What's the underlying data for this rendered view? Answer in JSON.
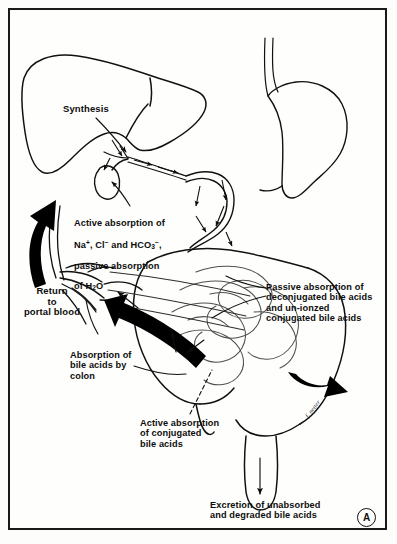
{
  "figure": {
    "panel_letter": "A",
    "artist_signature": "f. netter",
    "title_alt": "Enterohepatic circulation of bile acids"
  },
  "labels": {
    "synthesis": "Synthesis",
    "active_absorption_ions_line1": "Active absorption of",
    "active_absorption_ions_line2_pre": "Na",
    "active_absorption_ions_na_sup": "+",
    "active_absorption_ions_line2_mid": ", Cl",
    "active_absorption_ions_cl_sup": "−",
    "active_absorption_ions_line2_post": " and HCO",
    "active_absorption_ions_hco3_sub": "3",
    "active_absorption_ions_hco3_sup": "−",
    "active_absorption_ions_line2_end": ",",
    "active_absorption_ions_line3": "passive absorption",
    "active_absorption_ions_line4_pre": "of H",
    "active_absorption_ions_h2o_sub": "2",
    "active_absorption_ions_line4_post": "O",
    "return_to_portal_blood": "Return\nto\nportal blood",
    "passive_absorption": "Passive absorption of\ndeconjugated bile acids\nand un-ionzed\nconjugated bile acids",
    "absorption_by_colon": "Absorption of\nbile acids by\ncolon",
    "active_absorption_conjugated": "Active absorption\nof conjugated\nbile acids",
    "excretion": "Excretion of unabsorbed\nand degraded bile acids"
  },
  "colors": {
    "ink": "#0d0d0d",
    "paper": "#fefefc",
    "frame": "#1a1a1a",
    "organ_outline": "#111111",
    "thick_arrow": "#000000",
    "faint_line": "#5a5a5a"
  },
  "structures": [
    {
      "name": "liver",
      "description": "Large lobed liver outline, upper left"
    },
    {
      "name": "gallbladder",
      "description": "Pear-shaped gallbladder below liver"
    },
    {
      "name": "common-bile-duct",
      "description": "Duct from liver/gallbladder to duodenum"
    },
    {
      "name": "esophagus",
      "description": "Two parallel vertical lines, top center-right"
    },
    {
      "name": "stomach",
      "description": "Stomach body, upper right"
    },
    {
      "name": "duodenum",
      "description": "C-loop of duodenum"
    },
    {
      "name": "small-intestine",
      "description": "Coiled jejunum and ileum, center right"
    },
    {
      "name": "colon",
      "description": "Large intestine framing the small bowel"
    },
    {
      "name": "rectum",
      "description": "Terminal descending segment, bottom center"
    },
    {
      "name": "portal-vein",
      "description": "Branching vessel tree, left of center"
    }
  ],
  "arrows": [
    {
      "name": "portal-return-arrow",
      "style": "thick-black-curved",
      "direction": "up-left"
    },
    {
      "name": "ileal-absorption-arrow",
      "style": "thick-black-diagonal",
      "direction": "up-left"
    },
    {
      "name": "ileum-flow-arrow",
      "style": "thick-black-curved",
      "direction": "right"
    },
    {
      "name": "excretion-arrow",
      "style": "thin-black",
      "direction": "down"
    },
    {
      "name": "bile-duct-flow-arrows",
      "style": "thin-black",
      "direction": "toward-duodenum"
    },
    {
      "name": "colon-absorption-arrow",
      "style": "thin-black",
      "direction": "up"
    },
    {
      "name": "conjugated-absorption-arrow",
      "style": "thin-black",
      "direction": "down-left"
    }
  ]
}
